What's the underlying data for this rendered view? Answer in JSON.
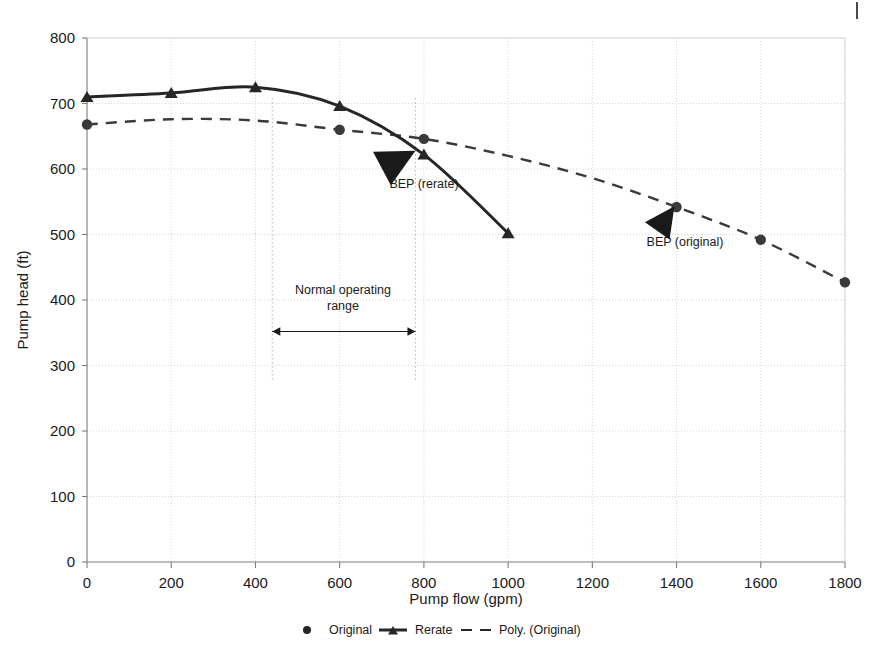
{
  "chart_data": {
    "type": "line",
    "title": "",
    "xlabel": "Pump flow (gpm)",
    "ylabel": "Pump head (ft)",
    "xlim": [
      0,
      1800
    ],
    "ylim": [
      0,
      800
    ],
    "xticks": [
      0,
      200,
      400,
      600,
      800,
      1000,
      1200,
      1400,
      1600,
      1800
    ],
    "yticks": [
      0,
      100,
      200,
      300,
      400,
      500,
      600,
      700,
      800
    ],
    "grid": true,
    "legend_position": "bottom",
    "series": [
      {
        "name": "Original",
        "style": "markers",
        "marker": "circle",
        "color": "#3a3a3a",
        "x": [
          0,
          600,
          800,
          1400,
          1600,
          1800
        ],
        "y": [
          668,
          660,
          646,
          542,
          492,
          427
        ]
      },
      {
        "name": "Rerate",
        "style": "solid-line-markers",
        "marker": "triangle",
        "color": "#262626",
        "x": [
          0,
          200,
          400,
          600,
          800,
          1000
        ],
        "y": [
          710,
          716,
          725,
          696,
          622,
          502
        ]
      },
      {
        "name": "Poly. (Original)",
        "style": "dashed-line",
        "marker": "none",
        "color": "#3a3a3a",
        "x": [
          0,
          200,
          400,
          600,
          800,
          1000,
          1200,
          1400,
          1600,
          1800
        ],
        "y": [
          668,
          676,
          674,
          660,
          646,
          620,
          586,
          542,
          492,
          427
        ]
      }
    ],
    "annotations": [
      {
        "text": "BEP (rerate)",
        "x": 800,
        "y": 575,
        "arrow_to_x": 780,
        "arrow_to_y": 640
      },
      {
        "text": "BEP (original)",
        "x": 1400,
        "y": 490,
        "arrow_to_x": 1400,
        "arrow_to_y": 545
      },
      {
        "text_line1": "Normal operating",
        "text_line2": "range",
        "from_x": 440,
        "to_x": 780,
        "y": 352
      }
    ]
  },
  "axes": {
    "x_title": "Pump flow (gpm)",
    "y_title": "Pump head (ft)",
    "x_tick_labels": [
      "0",
      "200",
      "400",
      "600",
      "800",
      "1000",
      "1200",
      "1400",
      "1600",
      "1800"
    ],
    "y_tick_labels": [
      "0",
      "100",
      "200",
      "300",
      "400",
      "500",
      "600",
      "700",
      "800"
    ]
  },
  "annotations": {
    "bep_rerate": "BEP (rerate)",
    "bep_original": "BEP (original)",
    "normal_range_line1": "Normal operating",
    "normal_range_line2": "range"
  },
  "legend": {
    "items": [
      {
        "label": "Original",
        "marker": "circle"
      },
      {
        "label": "Rerate",
        "marker": "line-triangle"
      },
      {
        "label": "Poly. (Original)",
        "marker": "dashed-line"
      }
    ]
  },
  "colors": {
    "ink": "#1a1a1a",
    "series_dark": "#262626",
    "grid": "#c9c9c9",
    "guide": "#b5b5b5",
    "background": "#ffffff"
  }
}
